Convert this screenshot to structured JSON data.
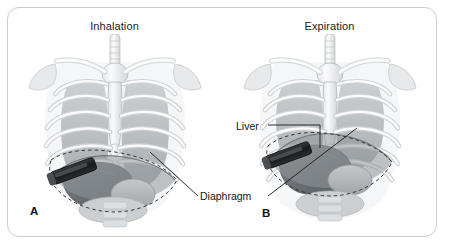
{
  "figure": {
    "caption_letters": {
      "a": "A",
      "b": "B"
    },
    "frame_color": "#c9cdd1",
    "background_color": "#ffffff"
  },
  "panels": [
    {
      "id": "panel-a",
      "letter": "A",
      "title": "Inhalation",
      "description": "Anterior view of thorax with rib cage, sternum, clavicles and trachea; the diaphragm dome and liver are displaced downward, and an ultrasound transducer is placed subcostally on the right side.",
      "structures": [
        "rib-cage",
        "sternum",
        "clavicle",
        "scapula",
        "trachea",
        "diaphragm",
        "liver",
        "stomach",
        "ultrasound-probe"
      ],
      "diaphragm_position": "low",
      "liver_position": "low"
    },
    {
      "id": "panel-b",
      "letter": "B",
      "title": "Expiration",
      "description": "Anterior view of thorax with rib cage, sternum, clavicles and trachea; the diaphragm dome and liver are elevated, and an ultrasound transducer is placed subcostally on the right side.",
      "structures": [
        "rib-cage",
        "sternum",
        "clavicle",
        "scapula",
        "trachea",
        "diaphragm",
        "liver",
        "stomach",
        "ultrasound-probe"
      ],
      "diaphragm_position": "high",
      "liver_position": "high"
    }
  ],
  "annotations": [
    {
      "id": "diaphragm",
      "label": "Diaphragm",
      "points_to": [
        "panel-a-diaphragm",
        "panel-b-diaphragm"
      ]
    },
    {
      "id": "liver",
      "label": "Liver",
      "points_to": [
        "panel-b-liver"
      ]
    }
  ],
  "colors": {
    "bone_light": "#f2f3f4",
    "bone_shadow": "#c9ccd0",
    "muscle_mid": "#9aa0a4",
    "liver_dark": "#6e7478",
    "organ_mid": "#b6babd",
    "probe_dark": "#242628",
    "leader_line": "#1b1b1b",
    "text": "#141414"
  }
}
